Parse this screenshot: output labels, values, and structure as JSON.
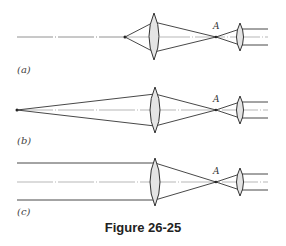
{
  "figure": {
    "caption": "Figure 26-25",
    "point_label": "A",
    "panels": [
      {
        "label": "(a)",
        "description": "Point source at finite distance, converging lens focuses to A, small lens collimates"
      },
      {
        "label": "(b)",
        "description": "Distant point source, converging lens focuses to A, small lens collimates"
      },
      {
        "label": "(c)",
        "description": "Parallel rays, converging lens focuses to A, small lens collimates"
      }
    ]
  },
  "colors": {
    "line": "#333333",
    "lens_fill": "#e4e4e4",
    "axis": "#777777"
  }
}
